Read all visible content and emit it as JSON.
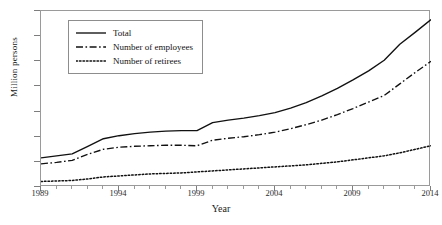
{
  "chart_data": {
    "type": "line",
    "title": "",
    "xlabel": "Year",
    "ylabel": "Million persons",
    "xlim": [
      1989,
      2014
    ],
    "ylim": [
      0,
      350
    ],
    "ytick_step": 50,
    "xtick_step": 5,
    "grid": false,
    "legend_position": "upper-left-inside",
    "x": [
      1989,
      1990,
      1991,
      1992,
      1993,
      1994,
      1995,
      1996,
      1997,
      1998,
      1999,
      2000,
      2001,
      2002,
      2003,
      2004,
      2005,
      2006,
      2007,
      2008,
      2009,
      2010,
      2011,
      2012,
      2013,
      2014
    ],
    "yticks": [
      0,
      50,
      100,
      150,
      200,
      250,
      300,
      350
    ],
    "xticks": [
      1989,
      1994,
      1999,
      2004,
      2009,
      2014
    ],
    "series": [
      {
        "name": "Total",
        "style": "solid",
        "color": "#111111",
        "values": [
          58,
          62,
          66,
          81,
          96,
          102,
          106,
          109,
          111,
          112,
          112,
          128,
          133,
          137,
          142,
          148,
          157,
          168,
          181,
          196,
          213,
          231,
          252,
          284,
          308,
          333
        ]
      },
      {
        "name": "Number of employees",
        "style": "dash-dot",
        "color": "#111111",
        "values": [
          46,
          49,
          53,
          65,
          75,
          79,
          81,
          82,
          83,
          83,
          82,
          93,
          97,
          100,
          104,
          109,
          116,
          124,
          133,
          144,
          156,
          169,
          182,
          205,
          228,
          250
        ]
      },
      {
        "name": "Number of retirees",
        "style": "dotted",
        "color": "#111111",
        "values": [
          11,
          12,
          13,
          16,
          20,
          22,
          24,
          26,
          27,
          28,
          30,
          32,
          34,
          36,
          38,
          40,
          42,
          44,
          47,
          50,
          54,
          58,
          62,
          68,
          75,
          82
        ]
      }
    ]
  },
  "axis": {
    "y_title": "Million persons",
    "x_title": "Year",
    "y_tick_labels": [
      "0",
      "50",
      "100",
      "150",
      "200",
      "250",
      "300",
      "350"
    ],
    "x_tick_labels": [
      "1989",
      "1994",
      "1999",
      "2004",
      "2009",
      "2014"
    ]
  },
  "legend": {
    "items": [
      {
        "label": "Total",
        "style": "solid"
      },
      {
        "label": "Number of employees",
        "style": "dash-dot"
      },
      {
        "label": "Number of retirees",
        "style": "dotted"
      }
    ]
  },
  "colors": {
    "line": "#111111",
    "frame": "#9a9a9a",
    "background": "#ffffff",
    "text": "#1a1a1a"
  }
}
